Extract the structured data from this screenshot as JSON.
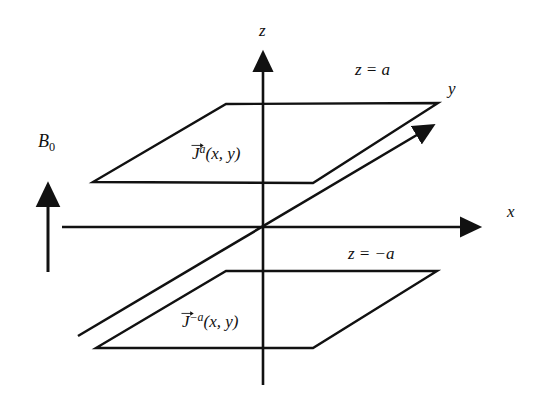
{
  "figure": {
    "type": "physics-diagram",
    "background_color": "#ffffff",
    "line_color": "#111111",
    "text_color": "#111111"
  },
  "axes": {
    "z": {
      "label": "z",
      "x": 259,
      "y": 22
    },
    "x": {
      "label": "x",
      "x": 507,
      "y": 212
    },
    "y": {
      "label": "y",
      "x": 448,
      "y": 87
    },
    "origin": {
      "x": 263,
      "y": 227
    }
  },
  "planes": [
    {
      "name": "upper-sheet",
      "plane_label": "z = a",
      "plane_label_pos": {
        "x": 355,
        "y": 61
      },
      "current_label_base": "J",
      "current_label_sup": "a",
      "current_label_args": "(x, y)",
      "current_label_pos": {
        "x": 192,
        "y": 144
      },
      "corners": "226,104 438,103 313,183 93,182"
    },
    {
      "name": "lower-sheet",
      "plane_label": "z = −a",
      "plane_label_pos": {
        "x": 348,
        "y": 245
      },
      "current_label_base": "J",
      "current_label_sup": "−a",
      "current_label_args": "(x, y)",
      "current_label_pos": {
        "x": 182,
        "y": 312
      },
      "corners": "226,271 437,271 313,348 96,348"
    }
  ],
  "field": {
    "label_base": "B",
    "label_sub": "0",
    "label_pos": {
      "x": 38,
      "y": 132
    },
    "arrow": {
      "x": 48,
      "y_tail": 272,
      "y_head": 182,
      "direction": "up"
    }
  },
  "icons": {
    "z_axis_arrow": "arrow-up-icon",
    "x_axis_arrow": "arrow-right-icon",
    "y_axis_arrow": "arrow-diagonal-up-right-icon",
    "b0_arrow": "arrow-up-icon",
    "vector_overbar": "vector-arrow-icon"
  }
}
